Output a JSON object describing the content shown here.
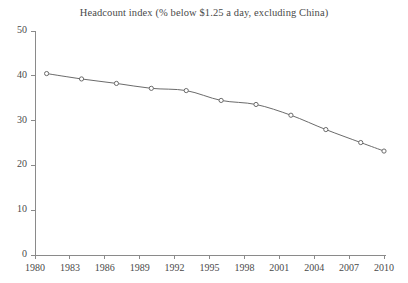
{
  "chart_data": {
    "type": "line",
    "title": "Headcount index (% below $1.25 a day, excluding China)",
    "xlabel": "",
    "ylabel": "",
    "xlim": [
      1980,
      2010
    ],
    "ylim": [
      0,
      50
    ],
    "grid": false,
    "legend": null,
    "series_name": "Headcount index",
    "marker": "open-circle",
    "line_color": "#6b6b6b",
    "marker_color": "#6b6b6b",
    "axis_color": "#8a8a8a",
    "x": [
      1981,
      1984,
      1987,
      1990,
      1993,
      1996,
      1999,
      2002,
      2005,
      2008,
      2010
    ],
    "values": [
      40.5,
      39.3,
      38.3,
      37.2,
      36.7,
      34.5,
      33.6,
      31.2,
      28.0,
      25.1,
      23.2
    ],
    "xticks": [
      1980,
      1983,
      1986,
      1989,
      1992,
      1995,
      1998,
      2001,
      2004,
      2007,
      2010
    ],
    "xtick_labels": [
      "1980",
      "1983",
      "1986",
      "1989",
      "1992",
      "1995",
      "1998",
      "2001",
      "2004",
      "2007",
      "2010"
    ],
    "yticks": [
      0,
      10,
      20,
      30,
      40,
      50
    ],
    "ytick_labels": [
      "0",
      "10",
      "20",
      "30",
      "40",
      "50"
    ]
  }
}
